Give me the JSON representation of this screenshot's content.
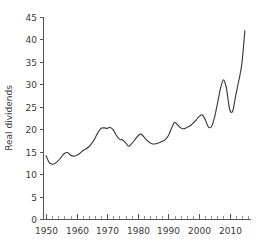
{
  "chart_data": {
    "type": "line",
    "title": "",
    "xlabel": "",
    "ylabel": "Real dividends",
    "xlim": [
      1949,
      2017
    ],
    "ylim": [
      0,
      45
    ],
    "grid": false,
    "legend": null,
    "y_ticks": [
      0,
      5,
      10,
      15,
      20,
      25,
      30,
      35,
      40,
      45
    ],
    "y_tick_labels": [
      "0",
      "5",
      "10",
      "15",
      "20",
      "25",
      "30",
      "35",
      "40",
      "45"
    ],
    "x_ticks": [
      1950,
      1960,
      1970,
      1980,
      1990,
      2000,
      2010
    ],
    "x_tick_labels": [
      "1950",
      "1960",
      "1970",
      "1980",
      "1990",
      "2000",
      "2010"
    ],
    "x_minor_tick_step": 2,
    "line_color": "#3c3c3c",
    "axis_color": "#555555",
    "background_color": "#ffffff",
    "series": [
      {
        "name": "Real dividends",
        "x": [
          1950,
          1951,
          1952,
          1953,
          1954,
          1955,
          1956,
          1957,
          1958,
          1959,
          1960,
          1961,
          1962,
          1963,
          1964,
          1965,
          1966,
          1967,
          1968,
          1969,
          1970,
          1971,
          1972,
          1973,
          1974,
          1975,
          1976,
          1977,
          1978,
          1979,
          1980,
          1981,
          1982,
          1983,
          1984,
          1985,
          1986,
          1987,
          1988,
          1989,
          1990,
          1991,
          1992,
          1993,
          1994,
          1995,
          1996,
          1997,
          1998,
          1999,
          2000,
          2001,
          2002,
          2003,
          2004,
          2005,
          2006,
          2007,
          2008,
          2009,
          2010,
          2011,
          2012,
          2013,
          2014,
          2015
        ],
        "values": [
          14.1,
          12.6,
          12.2,
          12.4,
          13.0,
          13.8,
          14.6,
          14.8,
          14.2,
          14.0,
          14.2,
          14.6,
          15.2,
          15.6,
          16.1,
          16.9,
          18.0,
          19.3,
          20.2,
          20.3,
          20.2,
          20.4,
          19.8,
          18.6,
          17.8,
          17.6,
          17.0,
          16.2,
          16.8,
          17.6,
          18.5,
          18.9,
          18.3,
          17.5,
          17.0,
          16.7,
          16.8,
          17.0,
          17.3,
          17.7,
          18.6,
          20.2,
          21.5,
          21.0,
          20.3,
          20.1,
          20.4,
          20.7,
          21.3,
          22.0,
          22.8,
          23.2,
          22.2,
          20.6,
          20.5,
          22.4,
          25.6,
          29.0,
          31.0,
          29.0,
          24.5,
          24.0,
          27.5,
          30.8,
          34.5,
          42.0
        ]
      }
    ]
  },
  "figure": {
    "plot_area": {
      "left_px": 43,
      "right_px": 251,
      "top_px": 17,
      "bottom_px": 219
    }
  }
}
